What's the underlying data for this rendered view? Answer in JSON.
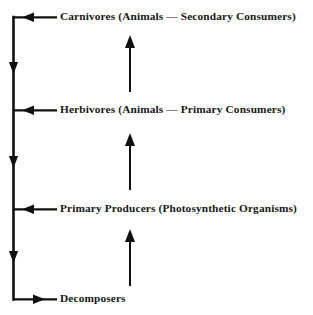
{
  "diagram": {
    "type": "ecological-energy-flow",
    "background_color": "#ffffff",
    "line_color": "#111111",
    "text_color": "#171717",
    "nodes": [
      {
        "id": "carnivores",
        "label": "Carnivores (Animals — Secondary Consumers)",
        "trophic_level": 3,
        "x": 60,
        "y": 17
      },
      {
        "id": "herbivores",
        "label": "Herbivores (Animals — Primary Consumers)",
        "trophic_level": 2,
        "x": 60,
        "y": 110
      },
      {
        "id": "producers",
        "label": "Primary Producers (Photosynthetic Organisms)",
        "trophic_level": 1,
        "x": 60,
        "y": 209
      },
      {
        "id": "decomposers",
        "label": "Decomposers",
        "trophic_level": 0,
        "x": 60,
        "y": 299
      }
    ],
    "connectors": [
      {
        "id": "carnivores-to-trunk",
        "from": "carnivores",
        "to": "trunk",
        "direction": "left",
        "arrowhead": "left"
      },
      {
        "id": "herbivores-to-trunk",
        "from": "herbivores",
        "to": "trunk",
        "direction": "left",
        "arrowhead": "left"
      },
      {
        "id": "producers-to-trunk",
        "from": "producers",
        "to": "trunk",
        "direction": "left",
        "arrowhead": "left"
      },
      {
        "id": "trunk-to-decomposers",
        "from": "trunk",
        "to": "decomposers",
        "direction": "right",
        "arrowhead": "right"
      },
      {
        "id": "trunk-descent-upper",
        "from": "carnivores-junction",
        "to": "herbivores-junction",
        "direction": "down",
        "arrowhead": "down"
      },
      {
        "id": "trunk-descent-middle",
        "from": "herbivores-junction",
        "to": "producers-junction",
        "direction": "down",
        "arrowhead": "down"
      },
      {
        "id": "trunk-descent-lower",
        "from": "producers-junction",
        "to": "decomposers-junction",
        "direction": "down",
        "arrowhead": "down"
      },
      {
        "id": "producers-to-herbivores",
        "from": "producers",
        "to": "herbivores",
        "direction": "up",
        "arrowhead": "up"
      },
      {
        "id": "herbivores-to-carnivores",
        "from": "herbivores",
        "to": "carnivores",
        "direction": "up",
        "arrowhead": "up"
      },
      {
        "id": "decomposers-to-producers",
        "from": "decomposers",
        "to": "producers",
        "direction": "up",
        "arrowhead": "up"
      }
    ]
  }
}
